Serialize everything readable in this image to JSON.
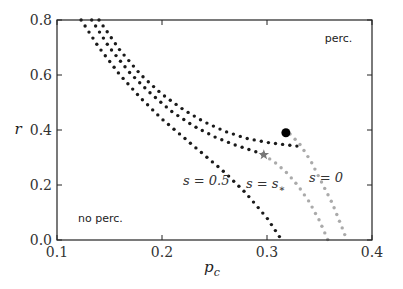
{
  "chart_data": {
    "type": "line",
    "title": "",
    "xlabel": "p_c",
    "ylabel": "r",
    "xlim": [
      0.1,
      0.4
    ],
    "ylim": [
      0.0,
      0.8
    ],
    "xticks": [
      0.1,
      0.2,
      0.3,
      0.4
    ],
    "xtick_labels": [
      "0.1",
      "0.2",
      "0.3",
      "0.4"
    ],
    "yticks": [
      0.0,
      0.2,
      0.4,
      0.6,
      0.8
    ],
    "ytick_labels": [
      "0.0",
      "0.2",
      "0.4",
      "0.6",
      "0.8"
    ],
    "grid": false,
    "legend": null,
    "region_labels": [
      {
        "text": "perc.",
        "x": 0.355,
        "y": 0.72
      },
      {
        "text": "no perc.",
        "x": 0.12,
        "y": 0.065
      }
    ],
    "curve_labels": [
      {
        "text": "s = 0.5",
        "x": 0.22,
        "y": 0.2
      },
      {
        "text": "s = s*",
        "x": 0.28,
        "y": 0.19
      },
      {
        "text": "s = 0",
        "x": 0.34,
        "y": 0.21
      }
    ],
    "series": [
      {
        "name": "s = 0.5",
        "style": "dotted",
        "color": "#1a1a1a",
        "x": [
          0.123,
          0.14,
          0.16,
          0.18,
          0.2,
          0.22,
          0.24,
          0.26,
          0.28,
          0.3,
          0.314
        ],
        "y": [
          0.8,
          0.7,
          0.6,
          0.515,
          0.44,
          0.375,
          0.31,
          0.245,
          0.17,
          0.08,
          0.0
        ]
      },
      {
        "name": "s = s* (first-order branch)",
        "style": "dotted",
        "color": "#1a1a1a",
        "x": [
          0.133,
          0.15,
          0.17,
          0.19,
          0.21,
          0.23,
          0.25,
          0.27,
          0.29,
          0.297
        ],
        "y": [
          0.8,
          0.7,
          0.605,
          0.53,
          0.465,
          0.415,
          0.375,
          0.345,
          0.32,
          0.31
        ]
      },
      {
        "name": "s = s* (continuous branch)",
        "style": "dotted",
        "color": "#aaaaaa",
        "x": [
          0.297,
          0.31,
          0.32,
          0.33,
          0.34,
          0.35,
          0.358
        ],
        "y": [
          0.31,
          0.275,
          0.24,
          0.195,
          0.14,
          0.07,
          0.0
        ]
      },
      {
        "name": "s = 0 (first-order branch)",
        "style": "dotted",
        "color": "#1a1a1a",
        "x": [
          0.14,
          0.16,
          0.18,
          0.2,
          0.22,
          0.24,
          0.26,
          0.28,
          0.3,
          0.32,
          0.332
        ],
        "y": [
          0.8,
          0.69,
          0.6,
          0.53,
          0.475,
          0.43,
          0.395,
          0.37,
          0.355,
          0.345,
          0.34
        ]
      },
      {
        "name": "s = 0 (continuous branch)",
        "style": "dotted",
        "color": "#aaaaaa",
        "x": [
          0.322,
          0.332,
          0.342,
          0.352,
          0.362,
          0.37,
          0.376
        ],
        "y": [
          0.385,
          0.345,
          0.285,
          0.21,
          0.135,
          0.06,
          0.0
        ]
      }
    ],
    "markers": [
      {
        "name": "critical point",
        "shape": "circle",
        "color": "#000000",
        "x": 0.318,
        "y": 0.39
      },
      {
        "name": "s* tricritical point",
        "shape": "star",
        "color": "#777777",
        "x": 0.297,
        "y": 0.31
      }
    ]
  }
}
